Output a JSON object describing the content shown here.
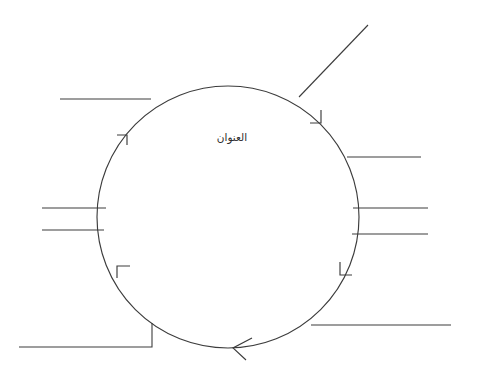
{
  "canvas": {
    "width": 482,
    "height": 383,
    "background_color": "#ffffff",
    "ink_color": "#3c3c3c"
  },
  "diagram": {
    "type": "cycle-diagram",
    "center_label": "العنوان",
    "center_label_language": "ar",
    "flow_direction": "clockwise",
    "circle": {
      "center_x": 228,
      "center_y": 217,
      "radius": 131
    },
    "arrowheads": [
      {
        "name": "arrowhead-upper-left",
        "angle_deg": 205,
        "style": "half-barb"
      },
      {
        "name": "arrowhead-upper-right",
        "angle_deg": 315,
        "style": "half-barb"
      },
      {
        "name": "arrowhead-lower-right",
        "angle_deg": 45,
        "style": "half-barb"
      },
      {
        "name": "arrowhead-lower-left",
        "angle_deg": 152,
        "style": "half-barb"
      },
      {
        "name": "arrowhead-bottom",
        "angle_deg": 93,
        "style": "open-v"
      }
    ],
    "connectors": [
      {
        "name": "connector-top-left",
        "label": "",
        "side": "top-left",
        "shape": "horizontal"
      },
      {
        "name": "connector-top-right",
        "label": "",
        "side": "top-right",
        "shape": "diagonal"
      },
      {
        "name": "connector-right-upper",
        "label": "",
        "side": "right-upper",
        "shape": "horizontal"
      },
      {
        "name": "connector-left-middle-a",
        "label": "",
        "side": "left-middle",
        "shape": "horizontal"
      },
      {
        "name": "connector-left-middle-b",
        "label": "",
        "side": "left-middle",
        "shape": "horizontal"
      },
      {
        "name": "connector-right-middle-a",
        "label": "",
        "side": "right-middle",
        "shape": "horizontal"
      },
      {
        "name": "connector-right-middle-b",
        "label": "",
        "side": "right-middle",
        "shape": "horizontal"
      },
      {
        "name": "connector-bottom-right",
        "label": "",
        "side": "bottom-right",
        "shape": "horizontal"
      },
      {
        "name": "connector-bottom-left",
        "label": "",
        "side": "bottom-left",
        "shape": "elbow"
      }
    ]
  }
}
